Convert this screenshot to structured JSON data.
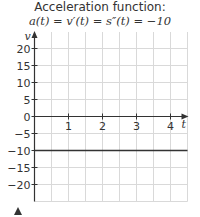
{
  "title_line1": "Acceleration function:",
  "title_line2": "a(t) = v′(t) = s″(t) = −10",
  "chart_data": {
    "type": "line",
    "xlabel": "t",
    "ylabel": "v",
    "xlim": [
      0,
      4.5
    ],
    "ylim": [
      -25,
      25
    ],
    "x_ticks": [
      "1",
      "2",
      "3",
      "4"
    ],
    "y_ticks": [
      "20",
      "15",
      "10",
      "5",
      "0",
      "−5",
      "−10",
      "−15",
      "−20"
    ],
    "grid": true,
    "series": [
      {
        "name": "a(t)",
        "x": [
          0,
          4.5
        ],
        "y": [
          -10,
          -10
        ]
      }
    ]
  },
  "colors": {
    "grid": "#d9d9d9",
    "axis": "#333333",
    "line": "#333333"
  }
}
